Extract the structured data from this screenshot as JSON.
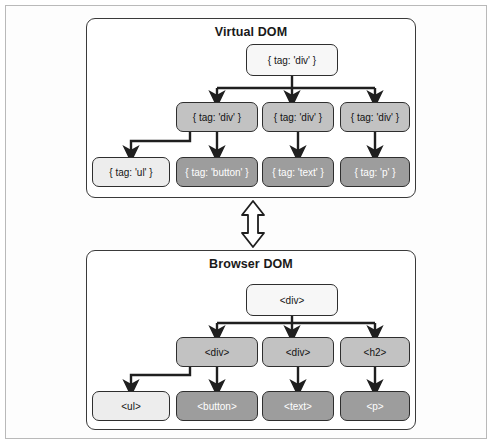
{
  "figure": {
    "colors": {
      "border": "#2e2e2e",
      "panel_border": "#3a3a3a",
      "frame": "#b9b9b9",
      "shade_white": "#f7f7f7",
      "shade_light": "#ededed",
      "shade_mid": "#c2c2c2",
      "shade_dark": "#9d9d9d",
      "background": "#ffffff"
    }
  },
  "sync_arrow": {
    "name": "bidirectional-sync-arrow",
    "direction": "vertical-double"
  },
  "panels": [
    {
      "id": "virtual-dom",
      "title": "Virtual DOM",
      "nodes": [
        {
          "id": "v-root",
          "label": "{ tag: 'div' }",
          "shade": "shade-white",
          "level": 1,
          "x": 246,
          "y": 44,
          "w": 92,
          "h": 32
        },
        {
          "id": "v-div-1",
          "label": "{ tag: 'div' }",
          "shade": "shade-mid",
          "level": 2,
          "x": 176,
          "y": 102,
          "w": 82,
          "h": 30
        },
        {
          "id": "v-div-2",
          "label": "{ tag: 'div' }",
          "shade": "shade-mid",
          "level": 2,
          "x": 262,
          "y": 102,
          "w": 72,
          "h": 30
        },
        {
          "id": "v-div-3",
          "label": "{ tag: 'div' }",
          "shade": "shade-mid",
          "level": 2,
          "x": 340,
          "y": 102,
          "w": 70,
          "h": 30
        },
        {
          "id": "v-ul",
          "label": "{ tag: 'ul' }",
          "shade": "shade-light",
          "level": 3,
          "x": 92,
          "y": 157,
          "w": 78,
          "h": 30
        },
        {
          "id": "v-button",
          "label": "{ tag: 'button' }",
          "shade": "shade-dark",
          "level": 3,
          "x": 176,
          "y": 157,
          "w": 82,
          "h": 30
        },
        {
          "id": "v-text",
          "label": "{ tag: 'text' }",
          "shade": "shade-dark",
          "level": 3,
          "x": 262,
          "y": 157,
          "w": 72,
          "h": 30
        },
        {
          "id": "v-p",
          "label": "{ tag: 'p' }",
          "shade": "shade-dark",
          "level": 3,
          "x": 340,
          "y": 157,
          "w": 70,
          "h": 30
        }
      ]
    },
    {
      "id": "browser-dom",
      "title": "Browser DOM",
      "nodes": [
        {
          "id": "b-root",
          "label": "<div>",
          "shade": "shade-white",
          "level": 1,
          "x": 246,
          "y": 284,
          "w": 92,
          "h": 32
        },
        {
          "id": "b-div-1",
          "label": "<div>",
          "shade": "shade-mid",
          "level": 2,
          "x": 176,
          "y": 337,
          "w": 82,
          "h": 30
        },
        {
          "id": "b-div-2",
          "label": "<div>",
          "shade": "shade-mid",
          "level": 2,
          "x": 262,
          "y": 337,
          "w": 72,
          "h": 30
        },
        {
          "id": "b-h2",
          "label": "<h2>",
          "shade": "shade-mid",
          "level": 2,
          "x": 340,
          "y": 337,
          "w": 70,
          "h": 30
        },
        {
          "id": "b-ul",
          "label": "<ul>",
          "shade": "shade-light",
          "level": 3,
          "x": 92,
          "y": 391,
          "w": 78,
          "h": 30
        },
        {
          "id": "b-button",
          "label": "<button>",
          "shade": "shade-dark",
          "level": 3,
          "x": 176,
          "y": 391,
          "w": 82,
          "h": 30
        },
        {
          "id": "b-text",
          "label": "<text>",
          "shade": "shade-dark",
          "level": 3,
          "x": 262,
          "y": 391,
          "w": 72,
          "h": 30
        },
        {
          "id": "b-p",
          "label": "<p>",
          "shade": "shade-dark",
          "level": 3,
          "x": 340,
          "y": 391,
          "w": 70,
          "h": 30
        }
      ]
    }
  ],
  "edges": {
    "virtual": [
      {
        "from": "v-root",
        "to": "v-div-1"
      },
      {
        "from": "v-root",
        "to": "v-div-2"
      },
      {
        "from": "v-root",
        "to": "v-div-3"
      },
      {
        "from": "v-div-1",
        "to": "v-ul"
      },
      {
        "from": "v-div-1",
        "to": "v-button"
      },
      {
        "from": "v-div-2",
        "to": "v-text"
      },
      {
        "from": "v-div-3",
        "to": "v-p"
      }
    ],
    "browser": [
      {
        "from": "b-root",
        "to": "b-div-1"
      },
      {
        "from": "b-root",
        "to": "b-div-2"
      },
      {
        "from": "b-root",
        "to": "b-h2"
      },
      {
        "from": "b-div-1",
        "to": "b-ul"
      },
      {
        "from": "b-div-1",
        "to": "b-button"
      },
      {
        "from": "b-div-2",
        "to": "b-text"
      },
      {
        "from": "b-h2",
        "to": "b-p"
      }
    ]
  }
}
